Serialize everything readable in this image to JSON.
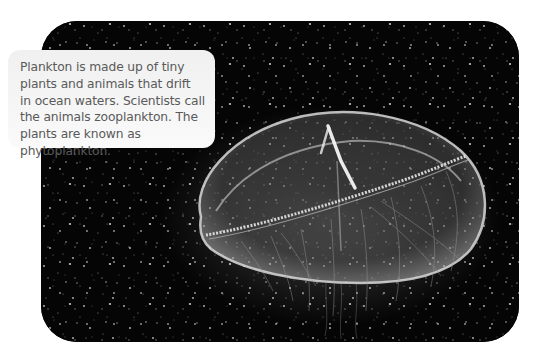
{
  "caption": {
    "text": "Plankton is made up of tiny plants and animals that drift in ocean waters. Scientists call the animals zooplankton. The plants are known as phytoplankton."
  },
  "photo": {
    "subject": "jellyfish",
    "description": "Grayscale photograph of a translucent moon jellyfish among drifting plankton specks on a black background",
    "background_color": "#050505"
  },
  "colors": {
    "caption_bg": "#f3f3f3",
    "caption_text": "#5a5a5a",
    "page_bg": "#ffffff"
  }
}
